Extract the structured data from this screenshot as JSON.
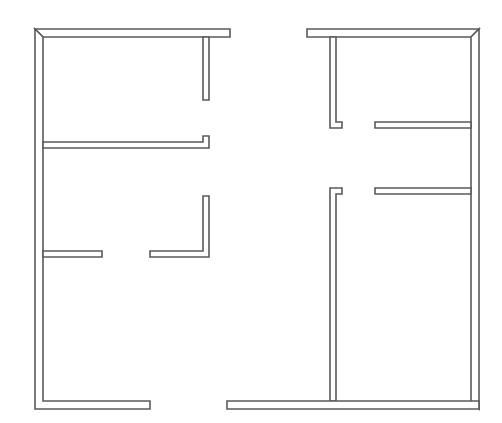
{
  "diagram": {
    "type": "floor-plan",
    "stroke_color": "#5a5a5a",
    "fill_color": "#ffffff",
    "background": "#ffffff",
    "walls": [
      {
        "name": "outer-top-left-wall",
        "path": "M35,29 L230,29 L230,37 L43,37 Z"
      },
      {
        "name": "outer-left-wall",
        "path": "M35,29 L43,37 L43,401 L150,401 L150,409 L35,409 Z"
      },
      {
        "name": "left-top-room-right-stub",
        "path": "M203,37 L209,37 L209,100 L203,100 Z"
      },
      {
        "name": "left-middle-partition",
        "path": "M43,142 L203,142 L203,136 L209,136 L209,148 L43,148 Z"
      },
      {
        "name": "left-lower-partition-left",
        "path": "M43,251 L102,251 L102,257 L43,257 Z"
      },
      {
        "name": "left-lower-partition-right",
        "path": "M150,251 L203,251 L203,196 L209,196 L209,257 L150,257 Z"
      },
      {
        "name": "outer-top-right-wall",
        "path": "M307,29 L479,29 L471,37 L336,37 L336,37 L307,37 Z"
      },
      {
        "name": "right-upper-vertical-wall",
        "path": "M330,37 L336,37 L336,122 L342,122 L342,128 L330,128 Z"
      },
      {
        "name": "outer-right-wall",
        "path": "M471,37 L479,29 L479,409 L471,401 Z"
      },
      {
        "name": "right-upper-partition",
        "path": "M375,122 L471,122 L471,128 L375,128 Z"
      },
      {
        "name": "right-lower-partition",
        "path": "M375,188 L471,188 L471,194 L375,194 Z"
      },
      {
        "name": "right-lower-vertical-wall",
        "path": "M330,188 L342,188 L342,194 L336,194 L336,401 L330,401 Z"
      },
      {
        "name": "outer-bottom-right-wall",
        "path": "M227,401 L479,401 L479,409 L227,409 Z"
      }
    ]
  }
}
